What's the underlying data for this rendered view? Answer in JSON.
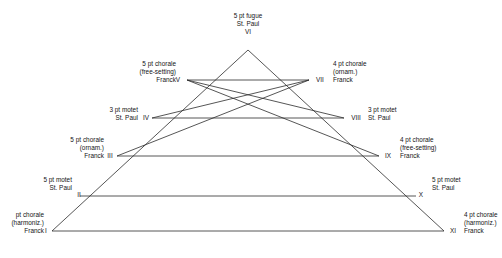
{
  "diagram": {
    "line_color": "#2b2b2b",
    "background": "#ffffff",
    "apex": {
      "numeral": "VI",
      "label_lines": [
        "5 pt fugue",
        "St. Paul"
      ]
    },
    "levels": [
      {
        "tier": 5,
        "left": {
          "numeral": "V",
          "label_lines": [
            "5 pt chorale",
            "(free-setting)",
            "Franck"
          ]
        },
        "right": {
          "numeral": "VII",
          "label_lines": [
            "4 pt chorale",
            "(ornam.)",
            "Franck"
          ]
        }
      },
      {
        "tier": 4,
        "left": {
          "numeral": "IV",
          "label_lines": [
            "3 pt motet",
            "St. Paul"
          ]
        },
        "right": {
          "numeral": "VIII",
          "label_lines": [
            "3 pt motet",
            "St. Paul"
          ]
        }
      },
      {
        "tier": 3,
        "left": {
          "numeral": "III",
          "label_lines": [
            "5 pt chorale",
            "(ornam.)",
            "Franck"
          ]
        },
        "right": {
          "numeral": "IX",
          "label_lines": [
            "4 pt chorale",
            "(free-setting)",
            "Franck"
          ]
        }
      },
      {
        "tier": 2,
        "left": {
          "numeral": "II",
          "label_lines": [
            "5 pt motet",
            "St. Paul"
          ]
        },
        "right": {
          "numeral": "X",
          "label_lines": [
            "5 pt motet",
            "St. Paul"
          ]
        }
      },
      {
        "tier": 1,
        "left": {
          "numeral": "I",
          "label_lines": [
            "pt chorale",
            "(harmoniz.)",
            "Franck"
          ]
        },
        "right": {
          "numeral": "XI",
          "label_lines": [
            "4 pt chorale",
            "(harmoniz.)",
            "Franck"
          ]
        }
      }
    ]
  }
}
